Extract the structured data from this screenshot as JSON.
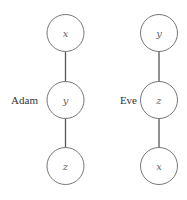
{
  "diagram": {
    "columns": [
      {
        "label": "Adam",
        "nodes": [
          "x",
          "y",
          "z"
        ]
      },
      {
        "label": "Eve",
        "nodes": [
          "y",
          "z",
          "x"
        ]
      }
    ]
  }
}
